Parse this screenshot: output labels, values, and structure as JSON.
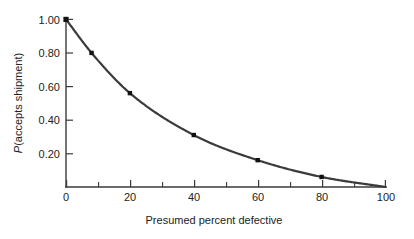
{
  "chart_data": {
    "type": "line",
    "title": "",
    "xlabel": "Presumed percent defective",
    "ylabel": "P(accepts shipment)",
    "ylabel_italic_prefix": "P",
    "ylabel_rest": "(accepts shipment)",
    "xlim": [
      0,
      100
    ],
    "ylim": [
      0,
      1.0
    ],
    "grid": false,
    "legend": null,
    "x_ticks": [
      0,
      20,
      40,
      60,
      80,
      100
    ],
    "x_tick_labels": [
      "0",
      "20",
      "40",
      "60",
      "80",
      "100"
    ],
    "x_minor_ticks": [
      10,
      30,
      50,
      70,
      90
    ],
    "y_ticks": [
      0.2,
      0.4,
      0.6,
      0.8,
      1.0
    ],
    "y_tick_labels": [
      "0.20",
      "0.40",
      "0.60",
      "0.80",
      "1.00"
    ],
    "series": [
      {
        "name": "Operating characteristic curve",
        "marker": "square",
        "color": "#3b3b3b",
        "x": [
          0,
          8,
          20,
          40,
          60,
          80,
          100
        ],
        "values": [
          1.0,
          0.8,
          0.56,
          0.31,
          0.16,
          0.06,
          0.0
        ]
      }
    ],
    "curve_description": "Smooth decreasing convex curve from P=1.00 at 0 percent defective to P=0 at 100 percent defective"
  },
  "figure": {
    "x_axis_title": "Presumed percent defective",
    "y_axis_title_italic": "P",
    "y_axis_title_rest": "(accepts shipment)"
  }
}
